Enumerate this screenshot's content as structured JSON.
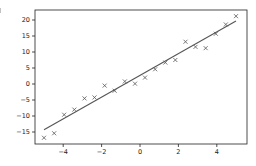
{
  "chart_data": {
    "type": "scatter",
    "title": "",
    "xlabel": "",
    "ylabel": "",
    "xlim": [
      -5.5,
      5.5
    ],
    "ylim": [
      -18.5,
      23
    ],
    "grid": false,
    "legend": null,
    "x_ticks": [
      -4,
      -2,
      0,
      2,
      4
    ],
    "x_tick_labels": [
      "−4",
      "−2",
      "0",
      "2",
      "4"
    ],
    "y_ticks": [
      -15,
      -10,
      -5,
      0,
      5,
      10,
      15,
      20
    ],
    "y_tick_labels": [
      "−15",
      "−10",
      "−5",
      "0",
      "5",
      "10",
      "15",
      "20"
    ],
    "series": [
      {
        "name": "data",
        "kind": "scatter",
        "marker": "x",
        "color": "#555555",
        "x": [
          -5.0,
          -4.47,
          -3.95,
          -3.42,
          -2.89,
          -2.37,
          -1.84,
          -1.32,
          -0.79,
          -0.26,
          0.26,
          0.79,
          1.32,
          1.84,
          2.37,
          2.89,
          3.42,
          3.95,
          4.47,
          5.0
        ],
        "y": [
          -16.8,
          -15.4,
          -9.6,
          -8.0,
          -4.5,
          -4.2,
          -0.5,
          -2.1,
          0.8,
          0.1,
          2.0,
          4.6,
          6.7,
          7.5,
          13.2,
          11.6,
          11.2,
          15.7,
          18.6,
          21.2
        ]
      },
      {
        "name": "fit",
        "kind": "line",
        "color": "#555555",
        "x": [
          -5.0,
          5.0
        ],
        "y": [
          -14.3,
          19.7
        ]
      }
    ]
  }
}
